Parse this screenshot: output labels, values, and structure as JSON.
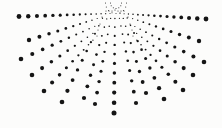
{
  "image": {
    "width": 222,
    "height": 128,
    "background_color": "#fcfcfb",
    "dot_color": "#151515",
    "description": "Half-sunburst of black round dots radiating downward and outward from a focal point at top center; dots are tiny near the apex (with small concentric arcs) and grow to about 5px diameter at the outer ends of each ray."
  },
  "dot_fan": {
    "apex": [
      115,
      2
    ],
    "rays": [
      {
        "from": [
          110,
          13.5
        ],
        "to": [
          19,
          16.5
        ],
        "dots": 15,
        "s1": 1.0,
        "s2": 4.8,
        "g": 1.06
      },
      {
        "from": [
          120,
          13.5
        ],
        "to": [
          206,
          19
        ],
        "dots": 15,
        "s1": 1.0,
        "s2": 4.8,
        "g": 1.06
      },
      {
        "from": [
          102,
          17
        ],
        "to": [
          29,
          40
        ],
        "dots": 11,
        "s1": 1.0,
        "s2": 4.4,
        "g": 1.09
      },
      {
        "from": [
          128,
          17
        ],
        "to": [
          199,
          41
        ],
        "dots": 11,
        "s1": 1.0,
        "s2": 4.4,
        "g": 1.09
      },
      {
        "from": [
          100,
          24
        ],
        "to": [
          21,
          59
        ],
        "dots": 11,
        "s1": 1.0,
        "s2": 4.6,
        "g": 1.09
      },
      {
        "from": [
          130,
          24
        ],
        "to": [
          204,
          62
        ],
        "dots": 11,
        "s1": 1.0,
        "s2": 4.6,
        "g": 1.09
      },
      {
        "from": [
          98,
          30
        ],
        "to": [
          32,
          75
        ],
        "dots": 10,
        "s1": 1.0,
        "s2": 4.6,
        "g": 1.09
      },
      {
        "from": [
          132,
          30
        ],
        "to": [
          193,
          75
        ],
        "dots": 10,
        "s1": 1.0,
        "s2": 4.6,
        "g": 1.09
      },
      {
        "from": [
          97,
          36
        ],
        "to": [
          44,
          91
        ],
        "dots": 10,
        "s1": 1.0,
        "s2": 4.6,
        "g": 1.09
      },
      {
        "from": [
          133,
          36
        ],
        "to": [
          183,
          90
        ],
        "dots": 10,
        "s1": 1.0,
        "s2": 4.6,
        "g": 1.09
      },
      {
        "from": [
          106,
          11
        ],
        "to": [
          62,
          102
        ],
        "dots": 11,
        "s1": 1.0,
        "s2": 4.7,
        "g": 1.05
      },
      {
        "from": [
          124,
          11
        ],
        "to": [
          164,
          99
        ],
        "dots": 11,
        "s1": 1.0,
        "s2": 4.7,
        "g": 1.05
      },
      {
        "from": [
          109,
          11
        ],
        "to": [
          84,
          98
        ],
        "dots": 10,
        "s1": 1.0,
        "s2": 4.2,
        "g": 1.05
      },
      {
        "from": [
          121,
          11
        ],
        "to": [
          146,
          93
        ],
        "dots": 10,
        "s1": 1.0,
        "s2": 4.2,
        "g": 1.05
      },
      {
        "from": [
          112,
          11
        ],
        "to": [
          95,
          104
        ],
        "dots": 11,
        "s1": 1.0,
        "s2": 4.2,
        "g": 1.05
      },
      {
        "from": [
          118,
          11
        ],
        "to": [
          136,
          103
        ],
        "dots": 11,
        "s1": 1.0,
        "s2": 4.2,
        "g": 1.05
      },
      {
        "from": [
          115,
          10
        ],
        "to": [
          114,
          113
        ],
        "dots": 12,
        "s1": 1.1,
        "s2": 5.0,
        "g": 1.02
      }
    ],
    "arc_dots": [
      [
        121.5,
        3,
        1.0
      ],
      [
        120.8,
        5.8,
        1.0
      ],
      [
        118.8,
        7.8,
        1.0
      ],
      [
        116,
        8.5,
        1.0
      ],
      [
        113.3,
        7.8,
        1.0
      ],
      [
        111.2,
        5.8,
        1.0
      ],
      [
        110.5,
        3,
        1.0
      ],
      [
        126.5,
        3,
        1.0
      ],
      [
        125.7,
        7,
        1.0
      ],
      [
        123.4,
        10.4,
        1.0
      ],
      [
        120,
        12.7,
        1.0
      ],
      [
        116,
        13.5,
        1.0
      ],
      [
        112,
        12.7,
        1.0
      ],
      [
        108.6,
        10.4,
        1.0
      ],
      [
        106.3,
        7,
        1.0
      ],
      [
        105.5,
        3,
        1.0
      ]
    ]
  }
}
